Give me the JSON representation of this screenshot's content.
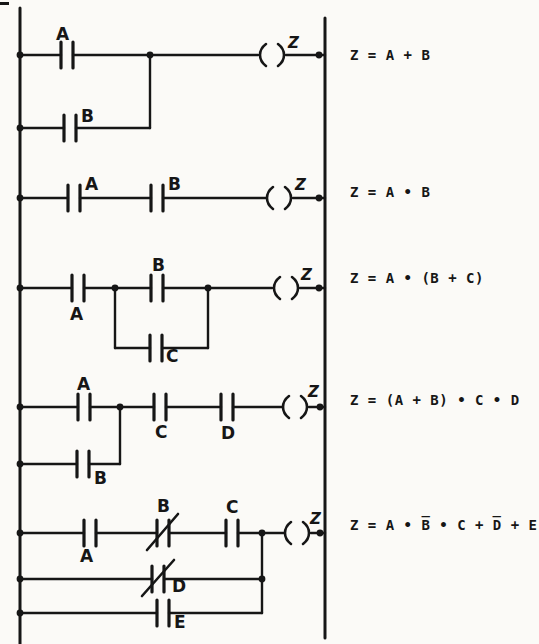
{
  "colors": {
    "ink": "#161616",
    "paper": "#fbfaf7"
  },
  "diagram_type": "relay-ladder-logic",
  "rungs": [
    {
      "id": 1,
      "contact_labels": {
        "A": "A",
        "B": "B"
      },
      "coil_label": "Z",
      "equation": "Z = A + B"
    },
    {
      "id": 2,
      "contact_labels": {
        "A": "A",
        "B": "B"
      },
      "coil_label": "Z",
      "equation": "Z = A • B"
    },
    {
      "id": 3,
      "contact_labels": {
        "A": "A",
        "B": "B",
        "C": "C"
      },
      "coil_label": "Z",
      "equation": "Z = A • (B + C)"
    },
    {
      "id": 4,
      "contact_labels": {
        "A": "A",
        "B": "B",
        "C": "C",
        "D": "D"
      },
      "coil_label": "Z",
      "equation": "Z = (A + B) • C • D"
    },
    {
      "id": 5,
      "contact_labels": {
        "A": "A",
        "B": "B",
        "C": "C",
        "D": "D",
        "E": "E"
      },
      "nc_contacts": [
        "B",
        "D"
      ],
      "coil_label": "Z",
      "equation": "Z = A • B̅ • C + D̅ + E"
    }
  ]
}
